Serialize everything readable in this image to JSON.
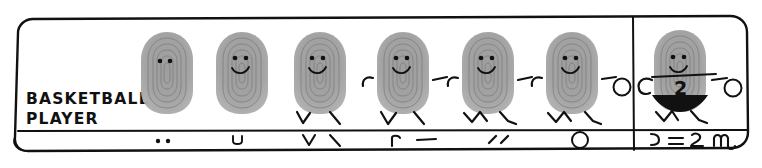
{
  "sheet": {
    "title_label": "BASKETBALL\nPLAYER",
    "label_line1": "BASKETBALL",
    "label_line2": "PLAYER",
    "medium": "thumbprint drawing",
    "frame_color": "#111111",
    "background_color": "#ffffff",
    "print_color": "#9a9a9a",
    "ink_color": "#111111"
  },
  "steps": [
    {
      "index": 1,
      "name": "thumbprint-eyes",
      "added_mark": "two dots",
      "strip_symbol": "• •",
      "features": [
        "thumbprint",
        "eyes"
      ]
    },
    {
      "index": 2,
      "name": "add-smile",
      "added_mark": "u curve",
      "strip_symbol": "u",
      "features": [
        "thumbprint",
        "eyes",
        "smile"
      ]
    },
    {
      "index": 3,
      "name": "add-straight-legs",
      "added_mark": "V and backslash",
      "strip_symbol": "V \\",
      "features": [
        "thumbprint",
        "eyes",
        "smile",
        "legs"
      ]
    },
    {
      "index": 4,
      "name": "add-arms",
      "added_mark": "hook and dash",
      "strip_symbol": "⌐ —",
      "features": [
        "thumbprint",
        "eyes",
        "smile",
        "legs",
        "arms"
      ]
    },
    {
      "index": 5,
      "name": "add-bent-running-legs",
      "added_mark": "two short slashes",
      "strip_symbol": "′ ′",
      "features": [
        "thumbprint",
        "eyes",
        "smile",
        "running-legs",
        "arms"
      ]
    },
    {
      "index": 6,
      "name": "add-basketball",
      "added_mark": "circle",
      "strip_symbol": "○",
      "features": [
        "thumbprint",
        "eyes",
        "smile",
        "running-legs",
        "arms",
        "basketball"
      ]
    },
    {
      "index": 7,
      "name": "add-uniform-number-shorts",
      "added_mark": "curve, line, number two, shorts",
      "strip_symbol": "⊃ = 2 ɯu",
      "features": [
        "thumbprint",
        "eyes",
        "smile",
        "running-legs",
        "arms",
        "basketball",
        "jersey-line",
        "number-2",
        "shorts"
      ]
    }
  ],
  "final_figure": {
    "jersey_number": "2",
    "has_shorts": true,
    "has_basketball": true
  }
}
